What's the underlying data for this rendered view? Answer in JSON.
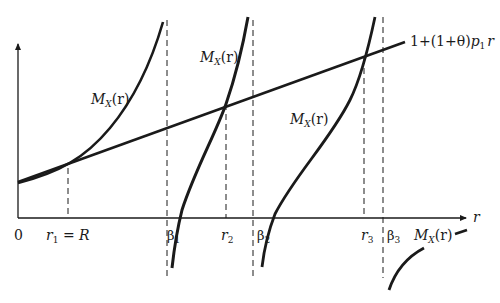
{
  "diagram": {
    "title": "",
    "axes": {
      "x_label": "r",
      "origin_label": "0"
    },
    "line": {
      "label_parts": [
        "1+(1+θ)",
        "p",
        "1",
        "r"
      ],
      "label": "1+(1+θ)p₁r"
    },
    "curve_labels": {
      "curve1": {
        "main": "M",
        "sub": "X",
        "rest": "(r)"
      },
      "curve2": {
        "main": "M",
        "sub": "X",
        "rest": "(r)"
      },
      "curve3": {
        "main": "M",
        "sub": "X",
        "rest": "(r)"
      },
      "curve4": {
        "main": "M",
        "sub": "X",
        "rest": "(r)"
      }
    },
    "x_ticks": [
      {
        "id": "r1",
        "main": "r",
        "sub": "1",
        "rest": " = R"
      },
      {
        "id": "beta1",
        "main": "β",
        "sub": "1",
        "rest": ""
      },
      {
        "id": "r2",
        "main": "r",
        "sub": "2",
        "rest": ""
      },
      {
        "id": "beta2",
        "main": "β",
        "sub": "2",
        "rest": ""
      },
      {
        "id": "r3",
        "main": "r",
        "sub": "3",
        "rest": ""
      },
      {
        "id": "beta3",
        "main": "β",
        "sub": "3",
        "rest": ""
      }
    ],
    "colors": {
      "ink": "#1a1a1a",
      "background": "#ffffff"
    }
  }
}
